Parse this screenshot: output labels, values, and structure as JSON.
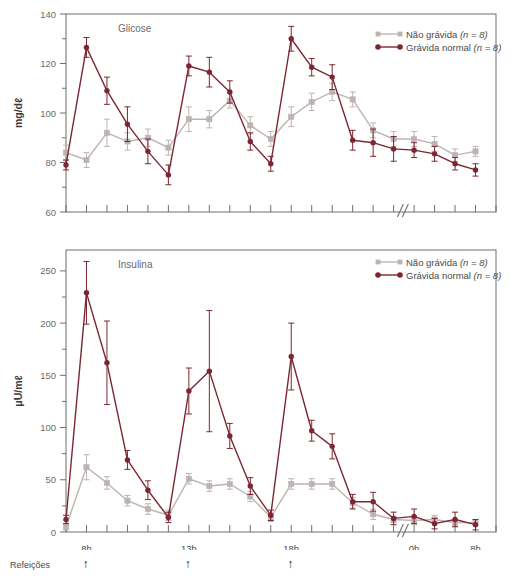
{
  "figure": {
    "colors": {
      "nonpregnant": "#bdb3b3",
      "pregnant": "#7d2632",
      "axis": "#6f6f6f",
      "text": "#4a4a4a"
    },
    "legend": [
      {
        "key": "nonpregnant",
        "label": "Não grávida",
        "n": "(n = 8)"
      },
      {
        "key": "pregnant",
        "label": "Grávida normal",
        "n": "(n = 8)"
      }
    ],
    "meals": {
      "label": "Refeições",
      "arrow": "↑",
      "at": [
        "8h",
        "13h",
        "18h"
      ]
    },
    "xaxis": {
      "tick_labels": [
        "8h",
        "13h",
        "18h",
        "0h",
        "8h"
      ],
      "tick_label_index": [
        1,
        6,
        11,
        17,
        20
      ],
      "n_ticks": 22,
      "axis_break": true,
      "break_after_index": 16
    }
  },
  "chart_data": [
    {
      "type": "line",
      "title": "Glicose",
      "xlabel": "",
      "ylabel": "mg/dℓ",
      "ylim": [
        60,
        140
      ],
      "yticks": [
        60,
        80,
        100,
        120,
        140
      ],
      "yminor_step": 10,
      "grid": false,
      "legend_position": "top-right",
      "x": [
        0,
        1,
        2,
        3,
        4,
        5,
        6,
        7,
        8,
        9,
        10,
        11,
        12,
        13,
        14,
        15,
        16,
        17,
        18,
        19,
        20
      ],
      "x_tick_times": [
        "7h",
        "8h",
        "9h",
        "10h",
        "11h",
        "12h",
        "13h",
        "14h",
        "15h",
        "16h",
        "17h",
        "18h",
        "19h",
        "20h",
        "21h",
        "22h",
        "23h",
        "0h",
        "2h",
        "5h",
        "8h"
      ],
      "series": [
        {
          "name": "Não grávida (n = 8)",
          "color": "#bdb3b3",
          "marker": "square",
          "values": [
            84,
            81,
            92,
            88.5,
            90,
            86,
            97.5,
            97.5,
            105,
            95,
            89.5,
            98.5,
            104.5,
            108.5,
            105.5,
            93,
            89.5,
            89.5,
            87.5,
            83,
            84.5
          ],
          "errors": [
            3,
            3,
            5.5,
            3.5,
            3.5,
            3,
            5,
            3.5,
            3,
            3.5,
            3,
            4,
            3.5,
            3.5,
            3,
            3,
            3,
            3,
            3,
            2.5,
            2
          ]
        },
        {
          "name": "Grávida normal (n = 8)",
          "color": "#7d2632",
          "marker": "circle",
          "values": [
            79,
            126.5,
            109,
            95.5,
            84.5,
            75,
            119,
            116.5,
            108.5,
            88.5,
            79.5,
            130,
            118.5,
            114.5,
            89,
            88,
            85.5,
            85,
            83.5,
            79.5,
            77
          ],
          "errors": [
            2,
            4,
            5.5,
            7,
            5,
            4,
            4,
            6,
            4.5,
            3.5,
            3,
            5,
            3.5,
            5,
            4,
            5.5,
            5,
            3,
            3,
            2.5,
            2.5
          ]
        }
      ]
    },
    {
      "type": "line",
      "title": "Insulina",
      "xlabel": "",
      "ylabel": "μU/mℓ",
      "ylim": [
        0,
        270
      ],
      "yticks": [
        0,
        50,
        100,
        150,
        200,
        250
      ],
      "yminor_step": 25,
      "grid": false,
      "legend_position": "top-right",
      "x": [
        0,
        1,
        2,
        3,
        4,
        5,
        6,
        7,
        8,
        9,
        10,
        11,
        12,
        13,
        14,
        15,
        16,
        17,
        18,
        19,
        20
      ],
      "x_tick_times": [
        "7h",
        "8h",
        "9h",
        "10h",
        "11h",
        "12h",
        "13h",
        "14h",
        "15h",
        "16h",
        "17h",
        "18h",
        "19h",
        "20h",
        "21h",
        "22h",
        "23h",
        "0h",
        "2h",
        "5h",
        "8h"
      ],
      "series": [
        {
          "name": "Não grávida (n = 8)",
          "color": "#bdb3b3",
          "marker": "square",
          "values": [
            5,
            62,
            47,
            30,
            22,
            16,
            51,
            44,
            46,
            34,
            14,
            46,
            46,
            46,
            28,
            17,
            12,
            11,
            12,
            9,
            9
          ],
          "errors": [
            3,
            12,
            6,
            5,
            5,
            5,
            5,
            5,
            5,
            5,
            4,
            5,
            5,
            5,
            5,
            5,
            3,
            4,
            4,
            3,
            3
          ]
        },
        {
          "name": "Grávida normal (n = 8)",
          "color": "#7d2632",
          "marker": "circle",
          "values": [
            12,
            229,
            162,
            69,
            40,
            14,
            135,
            154,
            92,
            44,
            16,
            168,
            97,
            82,
            29,
            29,
            13,
            15,
            8,
            12,
            7
          ],
          "errors": [
            4,
            30,
            40,
            9,
            9,
            5,
            22,
            58,
            12,
            8,
            5,
            32,
            10,
            12,
            7,
            9,
            6,
            7,
            5,
            7,
            5
          ]
        }
      ]
    }
  ]
}
